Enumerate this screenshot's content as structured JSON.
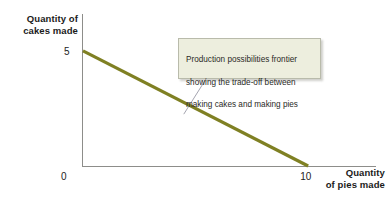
{
  "chart_data": {
    "type": "line",
    "title": "",
    "xlabel": "Quantity of pies made",
    "ylabel": "Quantity of cakes made",
    "ylabel_line1": "Quantity of",
    "ylabel_line2": "cakes made",
    "xlabel_line1": "Quantity",
    "xlabel_line2": "of pies made",
    "series": [
      {
        "name": "Production possibilities frontier",
        "color": "#7f8023",
        "x": [
          0,
          10
        ],
        "values": [
          5,
          0
        ],
        "points": [
          [
            0,
            5
          ],
          [
            10,
            0
          ]
        ]
      }
    ],
    "x_ticks": [
      "0",
      "10"
    ],
    "x_tick_values": [
      0,
      10
    ],
    "y_ticks": [
      "5"
    ],
    "y_tick_values": [
      5
    ],
    "xlim": [
      0,
      13
    ],
    "ylim": [
      0,
      6.6
    ],
    "grid": false,
    "legend": false,
    "annotations": [
      {
        "text": "Production possibilities frontier\nshowing the trade-off between\nmaking cakes and making pies",
        "line1": "Production possibilities frontier",
        "line2": "showing the trade-off between",
        "line3": "making cakes and making pies",
        "box_fill": "#edeede",
        "box_border": "#b9bbab",
        "leader_color": "#9a9aa6",
        "points_to": [
          4.5,
          2.25
        ]
      }
    ],
    "colors": {
      "line": "#7f8023",
      "axis": "#8d8d8a",
      "text": "#1b1b1b",
      "annotation_fill": "#edeede",
      "annotation_border": "#b9bbab",
      "background": "#ffffff"
    }
  }
}
